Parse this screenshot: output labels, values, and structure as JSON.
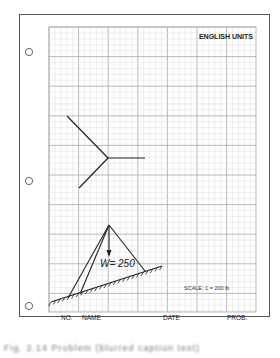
{
  "worksheet": {
    "header_label": "ENGLISH UNITS",
    "scale_label": "SCALE: 1 = 200 lb",
    "footer": {
      "no_label": "NO.",
      "name_label": "NAME",
      "date_label": "DATE",
      "prob_label": "PROB."
    },
    "load_label": "W= 250",
    "hole_count": 3
  },
  "diagrams": [
    {
      "id": "force-star",
      "description": "three concurrent force vectors meeting at a point: one horizontal to the right, one up-left, one down-left"
    },
    {
      "id": "tripod-on-incline",
      "description": "tripod/bipod frame on an inclined hatched ground surface with vertical load arrow W"
    }
  ],
  "caption": "Fig. 2.14  Problem (blurred caption text)",
  "colors": {
    "grid_minor": "#dcdcdc",
    "grid_major": "#a8a8a8",
    "ink": "#222222",
    "border": "#555555"
  }
}
